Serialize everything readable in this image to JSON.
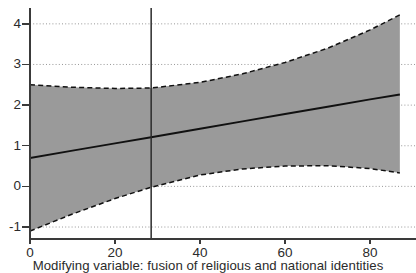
{
  "chart_data": {
    "type": "line",
    "title": "",
    "subtitle": "",
    "xlabel": "Modifying variable: fusion of religious and national identities",
    "ylabel": "",
    "xlim": [
      0,
      90.8
    ],
    "ylim": [
      -1.27,
      4.39
    ],
    "xticks": [
      0,
      20,
      40,
      60,
      80
    ],
    "xticklabels": [
      "0",
      "20",
      "40",
      "60",
      "80"
    ],
    "yticks": [
      -1,
      0,
      1,
      2,
      3,
      4
    ],
    "yticklabels": [
      "-1",
      "0",
      "1",
      "2",
      "3",
      "4"
    ],
    "grid": "horizontal-dotted",
    "legend": "none",
    "annotations": [
      {
        "name": "vertical-reference-line",
        "type": "vline",
        "x": 28.5,
        "style": "solid",
        "color": "#2b2b2b"
      }
    ],
    "series": [
      {
        "name": "marginal-effect",
        "style": "solid",
        "color": "#111111",
        "x": [
          0,
          10,
          20,
          28.5,
          40,
          50,
          60,
          70,
          80,
          87
        ],
        "values": [
          0.7,
          0.88,
          1.06,
          1.21,
          1.42,
          1.6,
          1.78,
          1.96,
          2.14,
          2.26
        ]
      },
      {
        "name": "upper-confidence-bound",
        "style": "dashed",
        "color": "#111111",
        "x": [
          0,
          10,
          20,
          28.5,
          40,
          50,
          60,
          70,
          80,
          87
        ],
        "values": [
          2.5,
          2.44,
          2.41,
          2.42,
          2.56,
          2.77,
          3.05,
          3.4,
          3.85,
          4.22
        ]
      },
      {
        "name": "lower-confidence-bound",
        "style": "dashed",
        "color": "#111111",
        "x": [
          0,
          10,
          20,
          28.5,
          40,
          50,
          60,
          70,
          80,
          87
        ],
        "values": [
          -1.1,
          -0.68,
          -0.3,
          -0.02,
          0.28,
          0.43,
          0.5,
          0.51,
          0.44,
          0.33
        ]
      }
    ],
    "band": {
      "name": "confidence-interval-band",
      "fill_color": "#9a9a9a",
      "between": [
        "lower-confidence-bound",
        "upper-confidence-bound"
      ]
    },
    "colors": {
      "band_fill": "#9a9a9a",
      "line": "#111111",
      "axis": "#3a3a3a",
      "grid": "#8c8c8c",
      "background": "#ffffff"
    }
  }
}
